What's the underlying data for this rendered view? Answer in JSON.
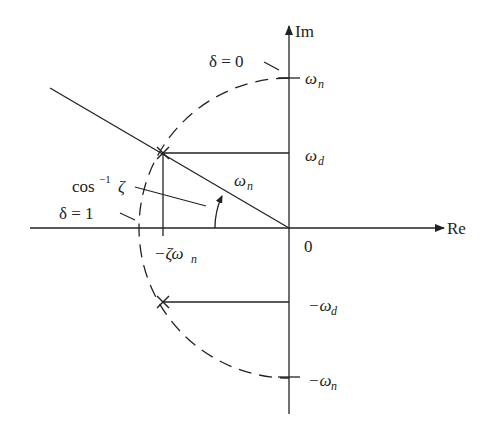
{
  "diagram": {
    "axes": {
      "real_label": "Re",
      "imag_label": "Im",
      "origin_label": "0"
    },
    "labels": {
      "wn_top": "ω",
      "wn_top_sub": "n",
      "wd_top": "ω",
      "wd_top_sub": "d",
      "wn_radius": "ω",
      "wn_radius_sub": "n",
      "neg_wd": "−ω",
      "neg_wd_sub": "d",
      "neg_wn": "−ω",
      "neg_wn_sub": "n",
      "zeta_wn": "−ζω",
      "zeta_wn_sub": "n",
      "delta0": "δ = 0",
      "delta1": "δ = 1",
      "acos": "cos",
      "acos_sup": "−1",
      "acos_zeta": "ζ"
    },
    "colors": {
      "stroke": "#222222",
      "background": "#ffffff"
    }
  }
}
